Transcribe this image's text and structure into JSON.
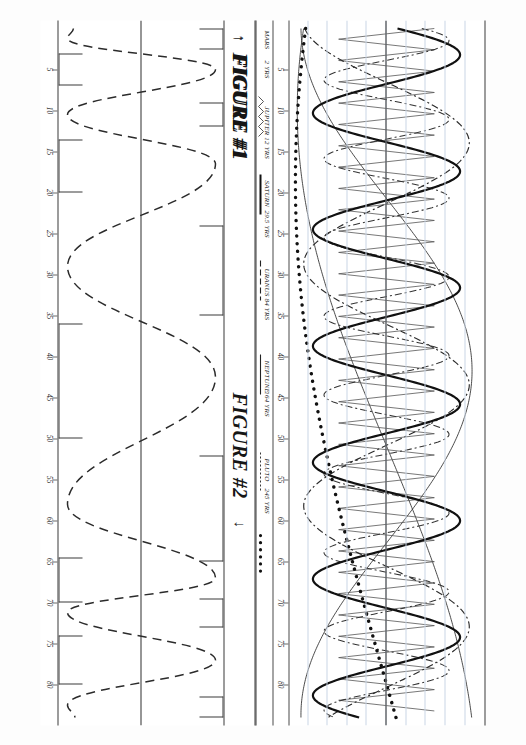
{
  "document": {
    "kind": "patent-style figure sheet",
    "orientation": "landscape content printed rotated 90 degrees",
    "background": "#ffffff",
    "ink": "#2f2f2f"
  },
  "figure1": {
    "title": "FIGURE #1",
    "arrow_glyph": "↑",
    "axis_ticks": [
      5,
      10,
      15,
      20,
      25,
      30,
      35,
      40,
      45,
      50,
      55,
      60,
      65,
      70,
      75,
      80
    ],
    "axis_range": [
      0,
      84
    ],
    "gridline_count": 9,
    "legend": [
      {
        "name": "MARS",
        "period": "2 YRS",
        "style": "zigzag",
        "color": "#4c4c4c"
      },
      {
        "name": "JUPITER",
        "period": "12 YRS",
        "style": "solid-bold",
        "color": "#111111"
      },
      {
        "name": "SATURN",
        "period": "29.5 YRS",
        "style": "dash-dot",
        "color": "#2b2b2b"
      },
      {
        "name": "URANUS",
        "period": "84 YRS",
        "style": "solid-thin",
        "color": "#2b2b2b"
      },
      {
        "name": "NEPTUNE",
        "period": "164 YRS",
        "style": "long-dash",
        "color": "#2b2b2b"
      },
      {
        "name": "PLUTO",
        "period": "245 YRS",
        "style": "dotted-bold",
        "color": "#111111"
      }
    ]
  },
  "figure2": {
    "title": "FIGURE #2",
    "arrow_glyph": "↓",
    "axis_ticks": [
      5,
      10,
      15,
      20,
      25,
      30,
      35,
      40,
      45,
      50,
      55,
      60,
      65,
      70,
      75,
      80
    ],
    "axis_range": [
      0,
      84
    ],
    "start_label": "BIRTH",
    "peak_labels": [
      "III",
      "V",
      "VII",
      "IX",
      "XI"
    ],
    "trough_labels": [
      "II",
      "IV",
      "VI",
      "VIII",
      "X"
    ],
    "wave_style": "dashed",
    "brackets": [
      {
        "label": "BIRTH",
        "side": "top",
        "start": 0,
        "end": 2.5
      },
      {
        "label": "III",
        "side": "top",
        "start": 9.0,
        "end": 12.0
      },
      {
        "label": "V",
        "side": "top",
        "start": 24.0,
        "end": 35.0
      },
      {
        "label": "VII",
        "side": "top",
        "start": 52.0,
        "end": 65.0
      },
      {
        "label": "IX",
        "side": "top",
        "start": 69.5,
        "end": 73.0
      },
      {
        "label": "XI",
        "side": "top",
        "start": 81.5,
        "end": 84.0
      },
      {
        "label": "II",
        "side": "bottom",
        "start": 3.0,
        "end": 7.0
      },
      {
        "label": "IV",
        "side": "bottom",
        "start": 13.5,
        "end": 20.0
      },
      {
        "label": "VI",
        "side": "bottom",
        "start": 36.0,
        "end": 50.0
      },
      {
        "label": "VIII",
        "side": "bottom",
        "start": 64.5,
        "end": 70.0
      },
      {
        "label": "X",
        "side": "bottom",
        "start": 74.0,
        "end": 80.0
      }
    ]
  },
  "chart_data": {
    "type": "line",
    "xlabel": "AGE (YEARS)",
    "ylabel": "",
    "xlim": [
      0,
      84
    ],
    "ylim": [
      -1,
      1
    ],
    "grid": true,
    "legend_position": "below-axis",
    "x": [
      5,
      10,
      15,
      20,
      25,
      30,
      35,
      40,
      45,
      50,
      55,
      60,
      65,
      70,
      75,
      80
    ],
    "series": [
      {
        "name": "MARS",
        "period_years": 2,
        "amplitude": 0.55,
        "dash": "zigzag",
        "width": 0.8
      },
      {
        "name": "JUPITER",
        "period_years": 12,
        "amplitude": 0.82,
        "dash": "solid",
        "width": 2.2
      },
      {
        "name": "SATURN",
        "period_years": 29.5,
        "amplitude": 0.9,
        "dash": "8 4 2 4",
        "width": 1.2
      },
      {
        "name": "URANUS",
        "period_years": 84,
        "amplitude": 0.95,
        "dash": "solid",
        "width": 0.9
      },
      {
        "name": "NEPTUNE",
        "period_years": 164,
        "amplitude": 0.95,
        "dash": "solid",
        "width": 0.9
      },
      {
        "name": "PLUTO",
        "period_years": 245,
        "amplitude": 0.95,
        "dash": "1 7",
        "width": 3.2
      }
    ],
    "figure2_series": [
      {
        "name": "COMPOSITE PHASE WAVE",
        "period_years_approx": 14.5,
        "dash": "9 6",
        "width": 1.4
      }
    ]
  }
}
